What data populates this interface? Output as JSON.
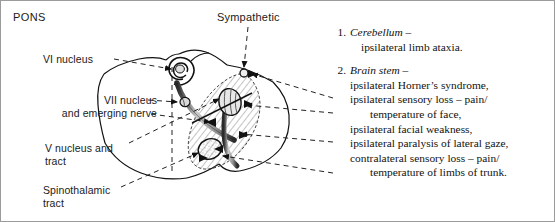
{
  "figure": {
    "region_label": "PONS",
    "background_color": "#ffffff",
    "ink_color": "#1a1a1a",
    "hatch_color": "#555555",
    "nucleus_fill": "#e4e4e4"
  },
  "diagram_labels": {
    "pons": "PONS",
    "sympathetic": "Sympathetic",
    "vi_nucleus": "VI nucleus",
    "vii_nucleus_line1": "VII nucleus",
    "vii_nucleus_line2": "and emerging nerve",
    "v_nucleus_line1": "V nucleus and",
    "v_nucleus_line2": "tract",
    "spinothalamic_line1": "Spinothalamic",
    "spinothalamic_line2": "tract"
  },
  "clinical_list": [
    {
      "number": "1.",
      "heading": "Cerebellum",
      "dash": "–",
      "lines": [
        {
          "text": "ipsilateral limb ataxia.",
          "indent": 1
        }
      ]
    },
    {
      "number": "2.",
      "heading": "Brain stem",
      "dash": "–",
      "lines": [
        {
          "text": "ipsilateral Horner’s syndrome,",
          "indent": 0
        },
        {
          "text": "ipsilateral sensory loss – pain/",
          "indent": 0
        },
        {
          "text": "temperature of face,",
          "indent": 2
        },
        {
          "text": "ipsilateral facial weakness,",
          "indent": 0
        },
        {
          "text": "ipsilateral paralysis of lateral gaze,",
          "indent": 0
        },
        {
          "text": "contralateral sensory loss – pain/",
          "indent": 0
        },
        {
          "text": "temperature of limbs of trunk.",
          "indent": 2
        }
      ]
    }
  ],
  "structures": [
    {
      "name": "vi-nucleus-spiral",
      "description": "spiral loop of abducens nucleus with facial nerve genu"
    },
    {
      "name": "vii-nucleus-oval",
      "description": "small filled oval of facial nucleus"
    },
    {
      "name": "facial-nerve-band",
      "description": "shaded band of emerging facial nerve"
    },
    {
      "name": "sympathetic-dot",
      "description": "small circle marking descending sympathetic fibres"
    },
    {
      "name": "v-nucleus-oval",
      "description": "upper striped oval: trigeminal nucleus and tract"
    },
    {
      "name": "spinothalamic-oval",
      "description": "lower stippled oval: spinothalamic tract"
    },
    {
      "name": "lesion-hatched-zone",
      "description": "diagonally hatched lesion territory"
    },
    {
      "name": "pons-outline",
      "description": "outline of the pons cross-section"
    },
    {
      "name": "midline-dash",
      "description": "vertical dashed midline"
    }
  ],
  "leader_lines": [
    {
      "name": "leader-vi-nucleus",
      "from": "VI nucleus",
      "to": "vi-nucleus-spiral"
    },
    {
      "name": "leader-vii-nucleus",
      "from": "VII nucleus",
      "to": "vii-nucleus-oval"
    },
    {
      "name": "leader-emerging-nerve",
      "from": "and emerging nerve",
      "to": "facial-nerve-band"
    },
    {
      "name": "leader-v-nucleus",
      "from": "V nucleus and tract",
      "to": "v-nucleus-oval"
    },
    {
      "name": "leader-spinothalamic",
      "from": "Spinothalamic tract",
      "to": "spinothalamic-oval"
    },
    {
      "name": "leader-sympathetic",
      "from": "Sympathetic",
      "to": "sympathetic-dot"
    },
    {
      "name": "leader-horner",
      "from": "sympathetic-dot",
      "to": "ipsilateral Horner’s syndrome,"
    },
    {
      "name": "leader-face-sensory",
      "from": "v-nucleus-oval",
      "to": "ipsilateral sensory loss – pain/"
    },
    {
      "name": "leader-facial-weakness",
      "from": "facial-nerve-band",
      "to": "ipsilateral facial weakness,"
    },
    {
      "name": "leader-contra-sensory",
      "from": "spinothalamic-oval",
      "to": "contralateral sensory loss – pain/"
    }
  ]
}
